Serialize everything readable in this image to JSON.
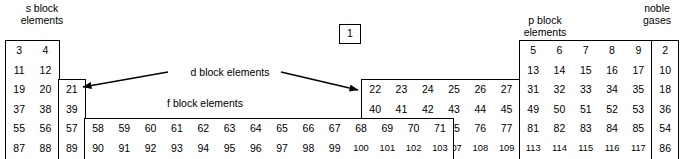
{
  "diagram": {
    "labels": {
      "s_block": "s block\nelements",
      "p_block": "p block\nelements",
      "d_block": "d block elements",
      "f_block": "f block elements",
      "noble_gases": "noble\ngases"
    },
    "colors": {
      "line": "#000000",
      "background": "#ffffff",
      "text": "#000000"
    }
  },
  "blocks": {
    "hydrogen": {
      "name": "hydrogen-box",
      "values": [
        "1"
      ]
    },
    "helium_noble_top": {
      "name": "noble-gas-column",
      "rows": [
        [
          "2"
        ],
        [
          "10"
        ],
        [
          "18"
        ],
        [
          "36"
        ],
        [
          "54"
        ],
        [
          "86"
        ],
        [
          "118"
        ]
      ]
    },
    "s_block": {
      "name": "s-block-grid",
      "rows": [
        [
          "3",
          "4"
        ],
        [
          "11",
          "12"
        ],
        [
          "19",
          "20"
        ],
        [
          "37",
          "38"
        ],
        [
          "55",
          "56"
        ],
        [
          "87",
          "88"
        ]
      ]
    },
    "group3": {
      "name": "group-3-column",
      "rows": [
        [
          "21"
        ],
        [
          "39"
        ],
        [
          "57"
        ],
        [
          "89"
        ]
      ]
    },
    "d_block": {
      "name": "d-block-grid",
      "rows": [
        [
          "22",
          "23",
          "24",
          "25",
          "26",
          "27",
          "28",
          "29",
          "30"
        ],
        [
          "40",
          "41",
          "42",
          "43",
          "44",
          "45",
          "46",
          "47",
          "48"
        ],
        [
          "72",
          "73",
          "74",
          "75",
          "76",
          "77",
          "78",
          "79",
          "80"
        ],
        [
          "104",
          "105",
          "106",
          "107",
          "108",
          "109",
          "110",
          "111",
          "112"
        ]
      ]
    },
    "f_block": {
      "name": "f-block-grid",
      "rows": [
        [
          "58",
          "59",
          "60",
          "61",
          "62",
          "63",
          "64",
          "65",
          "66",
          "67",
          "68",
          "69",
          "70",
          "71"
        ],
        [
          "90",
          "91",
          "92",
          "93",
          "94",
          "95",
          "96",
          "97",
          "98",
          "99",
          "100",
          "101",
          "102",
          "103"
        ]
      ]
    },
    "p_block": {
      "name": "p-block-grid",
      "rows": [
        [
          "5",
          "6",
          "7",
          "8",
          "9"
        ],
        [
          "13",
          "14",
          "15",
          "16",
          "17"
        ],
        [
          "31",
          "32",
          "33",
          "34",
          "35"
        ],
        [
          "49",
          "50",
          "51",
          "52",
          "53"
        ],
        [
          "81",
          "82",
          "83",
          "84",
          "85"
        ],
        [
          "113",
          "114",
          "115",
          "116",
          "117"
        ]
      ]
    }
  }
}
